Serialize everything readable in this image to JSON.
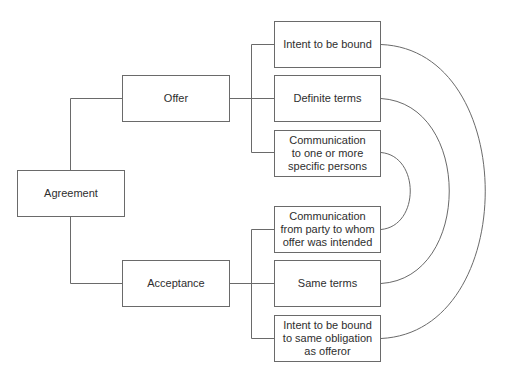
{
  "diagram": {
    "title": "",
    "colors": {
      "line": "#6a6a6a",
      "text": "#2e2e2e",
      "background": "#ffffff"
    },
    "root": {
      "label": "Agreement"
    },
    "branches": [
      {
        "label": "Offer",
        "elements": [
          {
            "label": "Intent to be bound"
          },
          {
            "label": "Definite terms"
          },
          {
            "label": "Communication\nto one or more\nspecific persons"
          }
        ]
      },
      {
        "label": "Acceptance",
        "elements": [
          {
            "label": "Communication\nfrom party to whom\noffer was intended"
          },
          {
            "label": "Same terms"
          },
          {
            "label": "Intent to be bound\nto same obligation\nas offeror"
          }
        ]
      }
    ],
    "correspondences": [
      {
        "offer": "Intent to be bound",
        "acceptance": "Intent to be bound to same obligation as offeror"
      },
      {
        "offer": "Definite terms",
        "acceptance": "Same terms"
      },
      {
        "offer": "Communication to one or more specific persons",
        "acceptance": "Communication from party to whom offer was intended"
      }
    ]
  }
}
